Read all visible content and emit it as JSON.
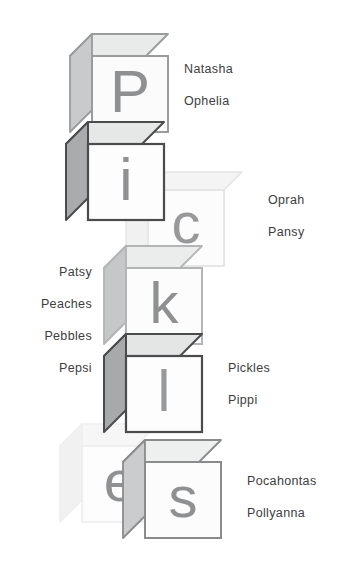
{
  "illustration": {
    "title": "Stacked alphabet blocks spelling Pickles with surrounding name labels",
    "word": "Pickles",
    "background_color": "#ffffff",
    "blocks": [
      {
        "id": "block-p",
        "letter": "P",
        "letter_color": "#8f9092",
        "face_color": "#fbfbfb",
        "top_color": "#e9eaea",
        "side_color": "#c9cacb",
        "edge_color": "#9a9b9d",
        "opacity": 1
      },
      {
        "id": "block-i",
        "letter": "i",
        "letter_color": "#8f9092",
        "face_color": "#fdfdfd",
        "top_color": "#e6e7e7",
        "side_color": "#a9abac",
        "edge_color": "#4a4b4d",
        "opacity": 1
      },
      {
        "id": "block-c",
        "letter": "c",
        "letter_color": "#98999b",
        "face_color": "#fcfcfc",
        "top_color": "#f4f4f4",
        "side_color": "#f0f0f0",
        "edge_color": "#e4e4e4",
        "opacity": 1
      },
      {
        "id": "block-k",
        "letter": "k",
        "letter_color": "#8f9092",
        "face_color": "#fcfcfc",
        "top_color": "#ebecec",
        "side_color": "#c6c7c8",
        "edge_color": "#b3b4b6",
        "opacity": 1
      },
      {
        "id": "block-l",
        "letter": "l",
        "letter_color": "#98999b",
        "face_color": "#fdfdfd",
        "top_color": "#e4e5e5",
        "side_color": "#a7a9aa",
        "edge_color": "#4a4b4d",
        "opacity": 1
      },
      {
        "id": "block-e",
        "letter": "e",
        "letter_color": "#8f9092",
        "face_color": "#fdfdfd",
        "top_color": "#f6f6f6",
        "side_color": "#f1f1f1",
        "edge_color": "#eeeeee",
        "opacity": 1
      },
      {
        "id": "block-s",
        "letter": "s",
        "letter_color": "#8f9092",
        "face_color": "#fcfcfc",
        "top_color": "#eeefef",
        "side_color": "#cbcccd",
        "edge_color": "#8a8b8d",
        "opacity": 1
      }
    ]
  },
  "labels": {
    "right_of_p": [
      "Natasha",
      "Ophelia"
    ],
    "right_of_c": [
      "Oprah",
      "Pansy"
    ],
    "left_of_k": [
      "Patsy",
      "Peaches",
      "Pebbles",
      "Pepsi"
    ],
    "right_of_l": [
      "Pickles",
      "Pippi"
    ],
    "right_of_s": [
      "Pocahontas",
      "Pollyanna"
    ]
  }
}
